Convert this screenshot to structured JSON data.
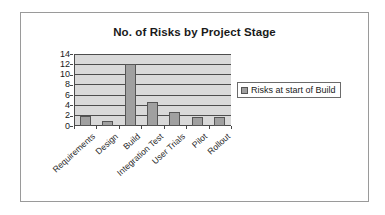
{
  "chart_data": {
    "type": "bar",
    "title": "No. of Risks by Project Stage",
    "xlabel": "",
    "ylabel": "",
    "categories": [
      "Requirements",
      "Design",
      "Build",
      "Integration Test",
      "User Trials",
      "Pilot",
      "Rollout"
    ],
    "values": [
      2,
      1,
      12,
      4.7,
      2.7,
      1.8,
      1.8
    ],
    "series": [
      {
        "name": "Risks at start of Build",
        "values": [
          2,
          1,
          12,
          4.7,
          2.7,
          1.8,
          1.8
        ],
        "color": "#a0a0a0"
      }
    ],
    "ylim": [
      0,
      14
    ],
    "y_ticks": [
      0,
      2,
      4,
      6,
      8,
      10,
      12,
      14
    ],
    "y_tick_labels": [
      "0",
      "2",
      "4",
      "6",
      "8",
      "10",
      "12",
      "14"
    ],
    "grid": true,
    "grid_axis": "y",
    "legend": [
      "Risks at start of Build"
    ],
    "legend_position": "right",
    "plot_background": "#d9d9d9",
    "axis_color": "#4a4a4a",
    "border_color": "#9a9a9a"
  },
  "legend": {
    "entry_label": "Risks at start of Build",
    "swatch_name": "series-color-swatch"
  }
}
